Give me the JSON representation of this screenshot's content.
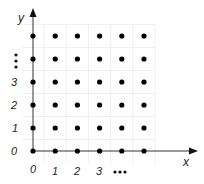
{
  "diagram": {
    "type": "integer-lattice",
    "axes": {
      "x_label": "x",
      "y_label": "y",
      "x_ticks": [
        "0",
        "1",
        "2",
        "3"
      ],
      "y_ticks": [
        "0",
        "1",
        "2",
        "3"
      ],
      "x_continuation": "•••",
      "y_continuation": "⋮"
    },
    "grid": {
      "columns": 6,
      "rows": 6,
      "origin_px": [
        33,
        151
      ],
      "col_spacing_px": 22.2,
      "row_spacing_px": 23,
      "dot_color": "#000000",
      "axis_color": "#222222",
      "gridline_color": "#f0f0f0"
    }
  }
}
